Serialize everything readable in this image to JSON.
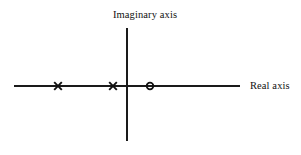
{
  "figure": {
    "title": "",
    "background_color": "#ffffff",
    "stroke_color": "#1a1a1a"
  },
  "labels": {
    "imaginary_axis": "Imaginary axis",
    "real_axis": "Real axis"
  },
  "chart_data": {
    "type": "scatter",
    "title": "",
    "subtitle": "",
    "xlabel": "Real axis",
    "ylabel": "Imaginary axis",
    "grid": false,
    "legend": "none",
    "axes": {
      "real_axis": {
        "orientation": "horizontal",
        "x_start_px": 14,
        "x_end_px": 240,
        "y_px": 86,
        "label": "Real axis"
      },
      "imaginary_axis": {
        "orientation": "vertical",
        "x_px": 127,
        "y_start_px": 28,
        "y_end_px": 141,
        "label": "Imaginary axis"
      },
      "origin_px": {
        "x": 127,
        "y": 86
      }
    },
    "series": [
      {
        "name": "poles",
        "marker": "x",
        "points": [
          {
            "label": "pole-1",
            "x_px": 58,
            "y_px": 86,
            "real": -3,
            "imag": 0
          },
          {
            "label": "pole-2",
            "x_px": 113,
            "y_px": 86,
            "real": -1,
            "imag": 0
          }
        ]
      },
      {
        "name": "zeros",
        "marker": "o",
        "points": [
          {
            "label": "zero-1",
            "x_px": 150,
            "y_px": 86,
            "real": 1,
            "imag": 0
          }
        ]
      }
    ]
  }
}
